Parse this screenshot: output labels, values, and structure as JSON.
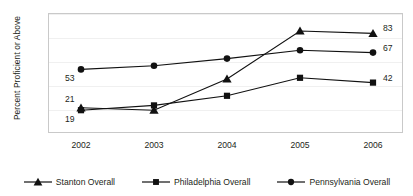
{
  "chart_data": {
    "type": "line",
    "title": "",
    "xlabel": "",
    "ylabel": "Percent Proficient or Above",
    "categories": [
      "2002",
      "2003",
      "2004",
      "2005",
      "2006"
    ],
    "ylim": [
      0,
      100
    ],
    "y_ticks": [
      "0",
      "20",
      "40",
      "60",
      "80",
      "100"
    ],
    "grid": true,
    "legend_position": "bottom",
    "series": [
      {
        "name": "Stanton Overall",
        "marker": "triangle",
        "color": "#111111",
        "values": [
          21,
          19,
          45,
          85,
          83
        ],
        "point_labels": [
          "21",
          "",
          "",
          "",
          "83"
        ]
      },
      {
        "name": "Philadelphia Overall",
        "marker": "square",
        "color": "#111111",
        "values": [
          19,
          23,
          31,
          46,
          42
        ],
        "point_labels": [
          "19",
          "",
          "",
          "",
          "42"
        ]
      },
      {
        "name": "Pennsylvania Overall",
        "marker": "circle",
        "color": "#111111",
        "values": [
          53,
          56,
          62,
          69,
          67
        ],
        "point_labels": [
          "53",
          "",
          "",
          "",
          "67"
        ]
      }
    ],
    "annotations": [
      {
        "text": "53",
        "x": "2002",
        "y": 53,
        "placement": "below-left"
      },
      {
        "text": "21",
        "x": "2002",
        "y": 21,
        "placement": "above-left"
      },
      {
        "text": "19",
        "x": "2002",
        "y": 19,
        "placement": "below-left"
      },
      {
        "text": "83",
        "x": "2006",
        "y": 83,
        "placement": "right"
      },
      {
        "text": "67",
        "x": "2006",
        "y": 67,
        "placement": "right"
      },
      {
        "text": "42",
        "x": "2006",
        "y": 42,
        "placement": "right"
      }
    ]
  }
}
